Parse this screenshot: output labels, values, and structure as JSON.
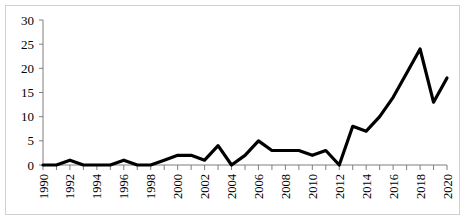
{
  "chart": {
    "frame_border_color": "#d0d0d0",
    "axis_color": "#7f7f7f",
    "line_color": "#000000",
    "background": "#ffffff"
  },
  "chart_data": {
    "type": "line",
    "title": "",
    "subtitle": "",
    "xlabel": "",
    "ylabel": "",
    "grid": false,
    "legend": false,
    "legend_position": "none",
    "xlim": [
      1990,
      2020
    ],
    "ylim": [
      0,
      30
    ],
    "yticks": [
      0,
      5,
      10,
      15,
      20,
      25,
      30
    ],
    "ytick_labels": [
      "0",
      "5",
      "10",
      "15",
      "20",
      "25",
      "30"
    ],
    "xticks": [
      1990,
      1992,
      1994,
      1996,
      1998,
      2000,
      2002,
      2004,
      2006,
      2008,
      2010,
      2012,
      2014,
      2016,
      2018,
      2020
    ],
    "xtick_labels": [
      "1990",
      "1992",
      "1994",
      "1996",
      "1998",
      "2000",
      "2002",
      "2004",
      "2006",
      "2008",
      "2010",
      "2012",
      "2014",
      "2016",
      "2018",
      "2020"
    ],
    "xtick_rotation": 90,
    "minor_xticks_every": 1,
    "x": [
      1990,
      1991,
      1992,
      1993,
      1994,
      1995,
      1996,
      1997,
      1998,
      1999,
      2000,
      2001,
      2002,
      2003,
      2004,
      2005,
      2006,
      2007,
      2008,
      2009,
      2010,
      2011,
      2012,
      2013,
      2014,
      2015,
      2016,
      2017,
      2018,
      2019,
      2020
    ],
    "values": [
      0,
      0,
      1,
      0,
      0,
      0,
      1,
      0,
      0,
      1,
      2,
      2,
      1,
      4,
      0,
      2,
      5,
      3,
      3,
      3,
      2,
      3,
      0,
      8,
      7,
      10,
      14,
      19,
      24,
      13,
      18
    ],
    "series": [
      {
        "name": "series-1",
        "values": [
          0,
          0,
          1,
          0,
          0,
          0,
          1,
          0,
          0,
          1,
          2,
          2,
          1,
          4,
          0,
          2,
          5,
          3,
          3,
          3,
          2,
          3,
          0,
          8,
          7,
          10,
          14,
          19,
          24,
          13,
          18
        ]
      }
    ]
  }
}
